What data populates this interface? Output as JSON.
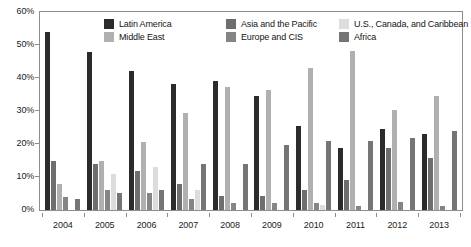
{
  "chart_data": {
    "type": "bar",
    "title": "",
    "subtitle": "",
    "xlabel": "",
    "ylabel": "",
    "categories": [
      "2004",
      "2005",
      "2006",
      "2007",
      "2008",
      "2009",
      "2010",
      "2011",
      "2012",
      "2013"
    ],
    "ylim": [
      0,
      60
    ],
    "y_ticks": [
      0,
      10,
      20,
      30,
      40,
      50,
      60
    ],
    "y_tick_labels": [
      "0%",
      "10%",
      "20%",
      "30%",
      "40%",
      "50%",
      "60%"
    ],
    "grid": false,
    "legend_position": "top-center",
    "value_suffix": "%",
    "series": [
      {
        "name": "Latin America",
        "color": "#2b2b2b",
        "values": [
          53.8,
          48.0,
          42.1,
          38.2,
          39.1,
          34.4,
          25.6,
          18.8,
          24.7,
          23.0
        ]
      },
      {
        "name": "Asia and the Pacific",
        "color": "#6e6e6e",
        "values": [
          14.8,
          13.8,
          11.9,
          8.0,
          4.2,
          4.2,
          6.1,
          9.2,
          18.9,
          15.9
        ]
      },
      {
        "name": "Middle East",
        "color": "#b0b0b0",
        "values": [
          8.0,
          14.9,
          20.7,
          29.3,
          37.3,
          36.3,
          43.0,
          48.1,
          30.4,
          34.5
        ]
      },
      {
        "name": "Europe and CIS",
        "color": "#858585",
        "values": [
          4.0,
          6.0,
          5.1,
          3.2,
          2.1,
          2.2,
          2.1,
          1.3,
          2.3,
          1.3
        ]
      },
      {
        "name": "U.S., Canada, and Caribbean",
        "color": "#dcdcdc",
        "values": [
          0.0,
          11.0,
          12.9,
          6.2,
          0.0,
          0.0,
          1.4,
          0.0,
          0.0,
          0.0
        ]
      },
      {
        "name": "Africa",
        "color": "#757575",
        "values": [
          3.2,
          5.1,
          6.1,
          13.9,
          13.9,
          19.6,
          20.9,
          20.9,
          21.7,
          23.9
        ]
      }
    ]
  },
  "legend": {
    "items": [
      {
        "label": "Latin America",
        "color": "#2b2b2b"
      },
      {
        "label": "Asia and the Pacific",
        "color": "#6e6e6e"
      },
      {
        "label": "U.S., Canada, and Caribbean",
        "color": "#dcdcdc"
      },
      {
        "label": "Middle East",
        "color": "#b0b0b0"
      },
      {
        "label": "Europe and CIS",
        "color": "#858585"
      },
      {
        "label": "Africa",
        "color": "#757575"
      }
    ]
  },
  "axes": {
    "frame_color": "#8d8d8d",
    "tick_color": "#8d8d8d",
    "text_color": "#1c1c1c"
  }
}
